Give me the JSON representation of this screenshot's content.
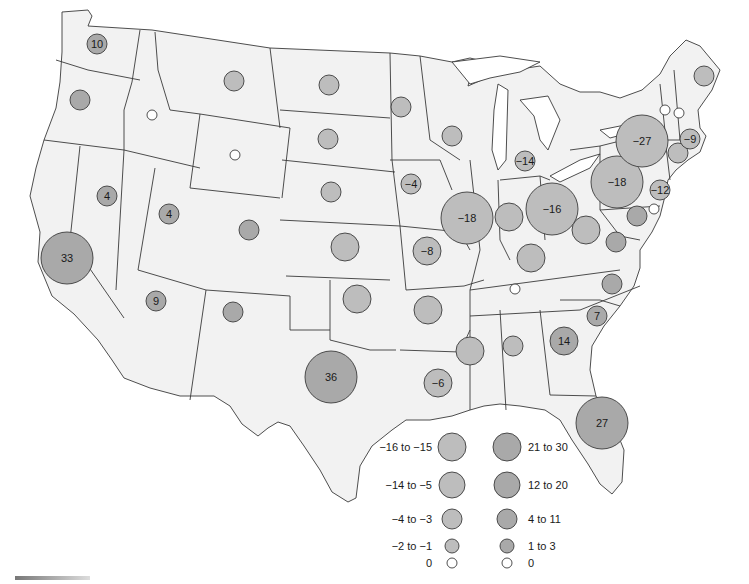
{
  "map": {
    "type": "proportional-symbol",
    "region": "Contiguous United States",
    "colors": {
      "state_fill": "#f2f2f2",
      "border": "#3a3a3a",
      "negative_bubble": "#bdbdbd",
      "positive_bubble": "#a9a9a9",
      "zero_bubble": "#ffffff"
    },
    "states": [
      {
        "id": "WA",
        "value": 10,
        "label": "10",
        "cx": 97,
        "cy": 44,
        "r": 10,
        "sign": "pos"
      },
      {
        "id": "OR",
        "value": null,
        "label": "",
        "cx": 80,
        "cy": 100,
        "r": 10,
        "sign": "pos"
      },
      {
        "id": "ID",
        "value": 0,
        "label": "",
        "cx": 152,
        "cy": 115,
        "r": 5,
        "sign": "zero"
      },
      {
        "id": "MT",
        "value": null,
        "label": "",
        "cx": 234,
        "cy": 81,
        "r": 10,
        "sign": "neg"
      },
      {
        "id": "WY",
        "value": 0,
        "label": "",
        "cx": 235,
        "cy": 155,
        "r": 5,
        "sign": "zero"
      },
      {
        "id": "CA",
        "value": 33,
        "label": "33",
        "cx": 67,
        "cy": 258,
        "r": 26,
        "sign": "pos"
      },
      {
        "id": "NV",
        "value": 4,
        "label": "4",
        "cx": 107,
        "cy": 196,
        "r": 10,
        "sign": "pos"
      },
      {
        "id": "UT",
        "value": 4,
        "label": "4",
        "cx": 169,
        "cy": 214,
        "r": 10,
        "sign": "pos"
      },
      {
        "id": "CO",
        "value": null,
        "label": "",
        "cx": 249,
        "cy": 230,
        "r": 10,
        "sign": "pos"
      },
      {
        "id": "AZ",
        "value": 9,
        "label": "9",
        "cx": 156,
        "cy": 301,
        "r": 10,
        "sign": "pos"
      },
      {
        "id": "NM",
        "value": null,
        "label": "",
        "cx": 233,
        "cy": 312,
        "r": 10,
        "sign": "pos"
      },
      {
        "id": "ND",
        "value": null,
        "label": "",
        "cx": 329,
        "cy": 85,
        "r": 10,
        "sign": "neg"
      },
      {
        "id": "SD",
        "value": null,
        "label": "",
        "cx": 328,
        "cy": 139,
        "r": 10,
        "sign": "neg"
      },
      {
        "id": "NE",
        "value": null,
        "label": "",
        "cx": 331,
        "cy": 192,
        "r": 10,
        "sign": "neg"
      },
      {
        "id": "KS",
        "value": null,
        "label": "",
        "cx": 345,
        "cy": 247,
        "r": 14,
        "sign": "neg"
      },
      {
        "id": "OK",
        "value": null,
        "label": "",
        "cx": 357,
        "cy": 299,
        "r": 14,
        "sign": "neg"
      },
      {
        "id": "TX",
        "value": 36,
        "label": "36",
        "cx": 331,
        "cy": 377,
        "r": 26,
        "sign": "pos"
      },
      {
        "id": "MN",
        "value": null,
        "label": "",
        "cx": 401,
        "cy": 107,
        "r": 10,
        "sign": "neg"
      },
      {
        "id": "IA",
        "value": -4,
        "label": "-4",
        "cx": 411,
        "cy": 184,
        "r": 10,
        "sign": "neg"
      },
      {
        "id": "MO",
        "value": -8,
        "label": "-8",
        "cx": 427,
        "cy": 251,
        "r": 14,
        "sign": "neg"
      },
      {
        "id": "AR",
        "value": null,
        "label": "",
        "cx": 428,
        "cy": 310,
        "r": 14,
        "sign": "neg"
      },
      {
        "id": "LA",
        "value": -6,
        "label": "-6",
        "cx": 438,
        "cy": 383,
        "r": 14,
        "sign": "neg"
      },
      {
        "id": "WI",
        "value": null,
        "label": "",
        "cx": 452,
        "cy": 136,
        "r": 10,
        "sign": "neg"
      },
      {
        "id": "IL",
        "value": -18,
        "label": "-18",
        "cx": 467,
        "cy": 218,
        "r": 26,
        "sign": "neg"
      },
      {
        "id": "MS",
        "value": null,
        "label": "",
        "cx": 470,
        "cy": 351,
        "r": 14,
        "sign": "neg"
      },
      {
        "id": "MI",
        "value": -14,
        "label": "-14",
        "cx": 525,
        "cy": 161,
        "r": 10,
        "sign": "neg"
      },
      {
        "id": "IN",
        "value": null,
        "label": "",
        "cx": 509,
        "cy": 217,
        "r": 14,
        "sign": "neg"
      },
      {
        "id": "KY",
        "value": null,
        "label": "",
        "cx": 531,
        "cy": 258,
        "r": 14,
        "sign": "neg"
      },
      {
        "id": "TN",
        "value": 0,
        "label": "",
        "cx": 515,
        "cy": 289,
        "r": 5,
        "sign": "zero"
      },
      {
        "id": "AL",
        "value": null,
        "label": "",
        "cx": 513,
        "cy": 346,
        "r": 10,
        "sign": "neg"
      },
      {
        "id": "OH",
        "value": -16,
        "label": "-16",
        "cx": 552,
        "cy": 209,
        "r": 26,
        "sign": "neg"
      },
      {
        "id": "GA",
        "value": 14,
        "label": "14",
        "cx": 564,
        "cy": 341,
        "r": 14,
        "sign": "pos"
      },
      {
        "id": "FL",
        "value": 27,
        "label": "27",
        "cx": 602,
        "cy": 423,
        "r": 26,
        "sign": "pos"
      },
      {
        "id": "SC",
        "value": 7,
        "label": "7",
        "cx": 597,
        "cy": 316,
        "r": 10,
        "sign": "pos"
      },
      {
        "id": "NC",
        "value": null,
        "label": "",
        "cx": 612,
        "cy": 284,
        "r": 10,
        "sign": "pos"
      },
      {
        "id": "WV",
        "value": null,
        "label": "",
        "cx": 586,
        "cy": 230,
        "r": 14,
        "sign": "neg"
      },
      {
        "id": "VA",
        "value": null,
        "label": "",
        "cx": 616,
        "cy": 242,
        "r": 10,
        "sign": "pos"
      },
      {
        "id": "PA",
        "value": -18,
        "label": "-18",
        "cx": 617,
        "cy": 182,
        "r": 26,
        "sign": "neg"
      },
      {
        "id": "MD",
        "value": null,
        "label": "",
        "cx": 637,
        "cy": 216,
        "r": 10,
        "sign": "pos"
      },
      {
        "id": "DE",
        "value": 0,
        "label": "",
        "cx": 654,
        "cy": 209,
        "r": 5,
        "sign": "zero"
      },
      {
        "id": "NJ",
        "value": -12,
        "label": "-12",
        "cx": 660,
        "cy": 190,
        "r": 10,
        "sign": "neg"
      },
      {
        "id": "NY",
        "value": -27,
        "label": "-27",
        "cx": 642,
        "cy": 141,
        "r": 26,
        "sign": "neg"
      },
      {
        "id": "CT",
        "value": null,
        "label": "",
        "cx": 678,
        "cy": 153,
        "r": 10,
        "sign": "neg"
      },
      {
        "id": "MA",
        "value": -9,
        "label": "-9",
        "cx": 690,
        "cy": 139,
        "r": 10,
        "sign": "neg"
      },
      {
        "id": "VT",
        "value": 0,
        "label": "",
        "cx": 665,
        "cy": 110,
        "r": 5,
        "sign": "zero"
      },
      {
        "id": "NH",
        "value": 0,
        "label": "",
        "cx": 679,
        "cy": 113,
        "r": 5,
        "sign": "zero"
      },
      {
        "id": "ME",
        "value": null,
        "label": "",
        "cx": 704,
        "cy": 76,
        "r": 10,
        "sign": "neg"
      }
    ]
  },
  "legend": {
    "negative": [
      {
        "label": "−16 to −15",
        "r": 14
      },
      {
        "label": "−14 to −5",
        "r": 13
      },
      {
        "label": "−4 to −3",
        "r": 10
      },
      {
        "label": "−2 to −1",
        "r": 7
      },
      {
        "label": "0",
        "r": 5
      }
    ],
    "positive": [
      {
        "label": "21 to 30",
        "r": 14
      },
      {
        "label": "12 to 20",
        "r": 13
      },
      {
        "label": "4 to 11",
        "r": 10
      },
      {
        "label": "1 to 3",
        "r": 7
      },
      {
        "label": "0",
        "r": 5
      }
    ]
  }
}
